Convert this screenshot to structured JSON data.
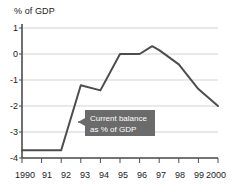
{
  "chart_data": {
    "type": "line",
    "title": "",
    "ylabel": "% of GDP",
    "xlabel": "",
    "categories": [
      "1990",
      "91",
      "92",
      "93",
      "94",
      "95",
      "96",
      "97",
      "98",
      "99",
      "2000"
    ],
    "x": [
      1990,
      1991,
      1992,
      1993,
      1994,
      1995,
      1996,
      1997,
      1998,
      1999,
      2000
    ],
    "values": [
      -3.7,
      -3.7,
      -3.7,
      -1.2,
      -1.4,
      0.0,
      0.0,
      0.3,
      -0.4,
      -1.35,
      -2.0
    ],
    "series": [
      {
        "name": "Current balance as % of GDP",
        "values": [
          -3.7,
          -3.7,
          -3.7,
          -1.2,
          -1.4,
          0.0,
          0.0,
          0.3,
          -0.4,
          -1.35,
          -2.0
        ]
      }
    ],
    "ylim": [
      -4,
      1
    ],
    "yticks": [
      1,
      0,
      -1,
      -2,
      -3,
      -4
    ],
    "ytick_labels": [
      "1",
      "0",
      "-1",
      "-2",
      "-3",
      "-4"
    ],
    "xlim": [
      1990,
      2000
    ],
    "grid": true,
    "legend": false,
    "line_color": "#4d4d4d",
    "grid_color": "#c8c8c8",
    "axis_color": "#4d4d4d",
    "text_color": "#1a1a1a",
    "annotations": [
      {
        "name": "current-balance-callout",
        "line1": "Current balance",
        "line2": "as % of GDP",
        "background": "#6b6b6b",
        "text_color": "#ffffff",
        "points_to_x": 1993.1,
        "points_to_y": -2.7
      }
    ]
  }
}
